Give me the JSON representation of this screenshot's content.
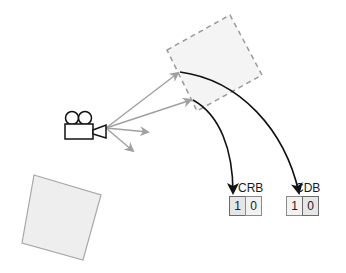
{
  "diagram": {
    "colors": {
      "background": "#ffffff",
      "dashed_square_fill": "#f4f4f4",
      "dashed_square_stroke": "#9a9a9a",
      "solid_square_fill": "#eeeeee",
      "solid_square_stroke": "#a8a8a8",
      "gray_arrow": "#a0a0a0",
      "black_arrow": "#111111"
    },
    "camera": {
      "icon": "video-camera-icon"
    },
    "buffers": [
      {
        "label": "CRB",
        "cells": [
          "1",
          "0"
        ]
      },
      {
        "label": "CDB",
        "cells": [
          "1",
          "0"
        ]
      }
    ]
  }
}
